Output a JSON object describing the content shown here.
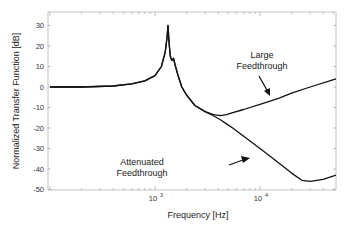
{
  "chart_data": {
    "type": "line",
    "title": "",
    "xlabel": "Frequency  [Hz]",
    "ylabel": "Normalized Transfer Function  [dB]",
    "xscale": "log",
    "xlim": [
      100,
      53000
    ],
    "ylim": [
      -50,
      35
    ],
    "xticks": [
      {
        "value": 1000,
        "base": "10",
        "exp": "3"
      },
      {
        "value": 10000,
        "base": "10",
        "exp": "4"
      }
    ],
    "yticks": [
      30,
      20,
      10,
      0,
      -10,
      -20,
      -30,
      -40,
      -50
    ],
    "grid": false,
    "legend": null,
    "series": [
      {
        "name": "Large Feedthrough",
        "x": [
          100,
          200,
          400,
          600,
          800,
          1000,
          1150,
          1250,
          1300,
          1330,
          1360,
          1400,
          1450,
          1500,
          1550,
          1650,
          1800,
          2000,
          2400,
          3000,
          3600,
          4200,
          4800,
          5500,
          7000,
          10000,
          15000,
          20000,
          30000,
          53000
        ],
        "y": [
          0,
          0,
          0.5,
          1.5,
          3,
          5.5,
          10,
          17,
          24,
          30,
          22,
          15,
          13,
          14,
          11,
          6,
          0,
          -4,
          -9,
          -12,
          -13.5,
          -14,
          -13.5,
          -12.5,
          -11,
          -8.5,
          -5.5,
          -3,
          0,
          4
        ]
      },
      {
        "name": "Attenuated Feedthrough",
        "x": [
          100,
          200,
          400,
          600,
          800,
          1000,
          1150,
          1250,
          1300,
          1330,
          1360,
          1400,
          1450,
          1500,
          1550,
          1650,
          1800,
          2000,
          2400,
          3000,
          3600,
          4200,
          4800,
          5500,
          7000,
          10000,
          15000,
          20000,
          25000,
          30000,
          40000,
          53000
        ],
        "y": [
          0,
          0,
          0.5,
          1.5,
          3,
          5.5,
          10,
          17,
          24,
          30,
          22,
          15,
          13,
          14,
          11,
          6,
          0,
          -4,
          -9,
          -12,
          -14,
          -16,
          -18,
          -20,
          -24,
          -30,
          -37,
          -42,
          -45.5,
          -46,
          -45,
          -43
        ]
      }
    ],
    "annotations": [
      {
        "text_lines": [
          "Large",
          "Feedthrough"
        ],
        "arrow_to_series": "Large Feedthrough"
      },
      {
        "text_lines": [
          "Attenuated",
          "Feedthrough"
        ],
        "arrow_to_series": "Attenuated Feedthrough"
      }
    ]
  }
}
